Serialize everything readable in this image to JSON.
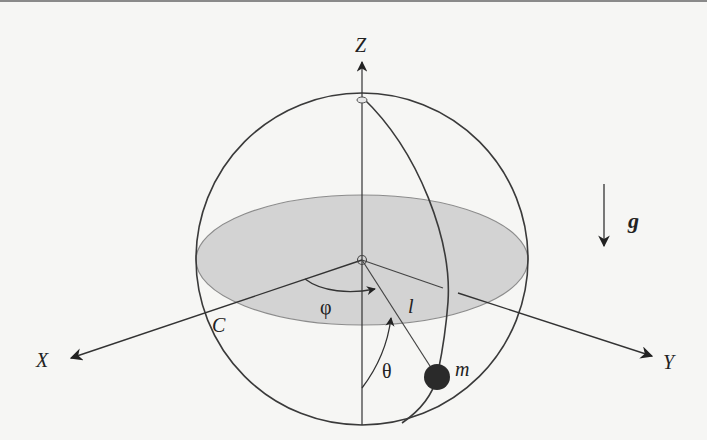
{
  "diagram": {
    "labels": {
      "z_axis": "Z",
      "x_axis": "X",
      "y_axis": "Y",
      "gravity": "g",
      "mass": "m",
      "length": "l",
      "phi": "φ",
      "theta": "θ",
      "circle": "C"
    },
    "colors": {
      "line": "#333333",
      "equatorial_plane_fill": "#d3d3d3",
      "mass_fill": "#2a2a2a",
      "background": "#f6f6f4"
    },
    "geometry": {
      "sphere_center": [
        362,
        257
      ],
      "sphere_radius": 166,
      "equator_rx": 166,
      "equator_ry": 65,
      "mass_position": [
        437,
        375
      ],
      "mass_radius": 13
    }
  }
}
